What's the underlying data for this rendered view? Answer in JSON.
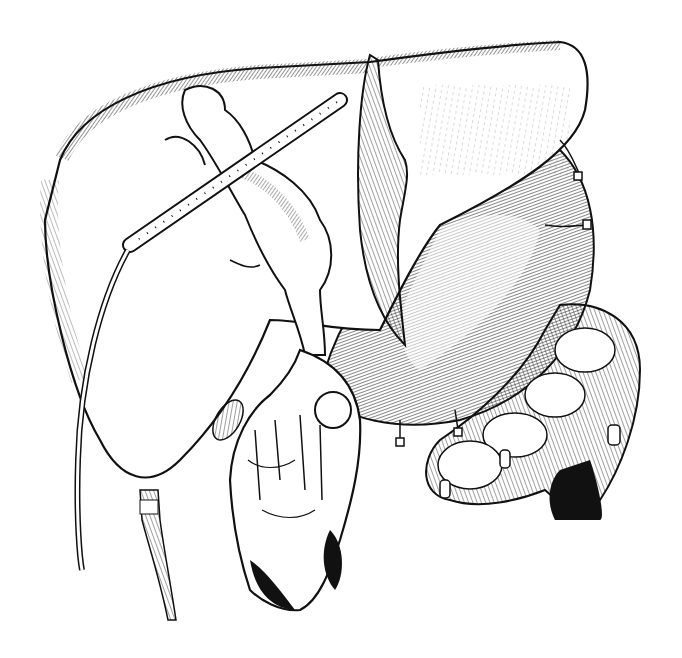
{
  "illustration": {
    "style": "pen-and-ink anatomical line drawing",
    "background": "#ffffff",
    "ink": "#111111",
    "caption": "",
    "structures": [
      {
        "id": "liver",
        "description": "large liver lobes, upper left to upper right, hatched shading"
      },
      {
        "id": "falciform-ligament",
        "description": "vertical fold dividing liver lobes near center top"
      },
      {
        "id": "perforated-drain",
        "description": "curved perforated tube with holes running diagonally across liver, continuing down the left side"
      },
      {
        "id": "biliary-tree",
        "description": "dilated lumpy ducts below the drain, descending toward tumor mass"
      },
      {
        "id": "tumor-mass",
        "description": "lobulated drooping mass lower center with dark shadowed base"
      },
      {
        "id": "stomach",
        "description": "large finely hatched curved organ to the right"
      },
      {
        "id": "colon",
        "description": "segmented bowel loops lower right"
      },
      {
        "id": "gallbladder-tube",
        "description": "tapering tube hanging from bottom of left liver lobe"
      },
      {
        "id": "ligatures",
        "description": "small tied vessels along stomach curvature"
      }
    ]
  }
}
